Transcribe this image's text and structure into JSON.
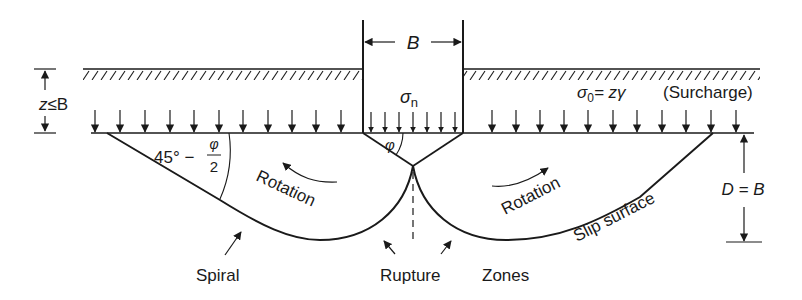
{
  "figure": {
    "type": "bearing-capacity failure mechanism (shallow strip footing)",
    "colors": {
      "ink": "#1a1a1a",
      "background": "#ffffff"
    }
  },
  "footing": {
    "width_label": "B",
    "pressure_label_sym": "σ",
    "pressure_label_sub": "n",
    "wedge_angle_label": "φ"
  },
  "depth": {
    "label_z": "z",
    "label_rel": "≤B"
  },
  "surcharge": {
    "sym": "σ",
    "sub": "0",
    "eq": "= zγ",
    "label": "(Surcharge)"
  },
  "failure_zone": {
    "angle_prefix": "45° −",
    "angle_num": "φ",
    "angle_den": "2",
    "rotation_left": "Rotation",
    "rotation_right": "Rotation",
    "slip_surface": "Slip surface",
    "depth_label": "D = B"
  },
  "bottom_labels": {
    "spiral": "Spiral",
    "rupture": "Rupture",
    "zones": "Zones"
  }
}
